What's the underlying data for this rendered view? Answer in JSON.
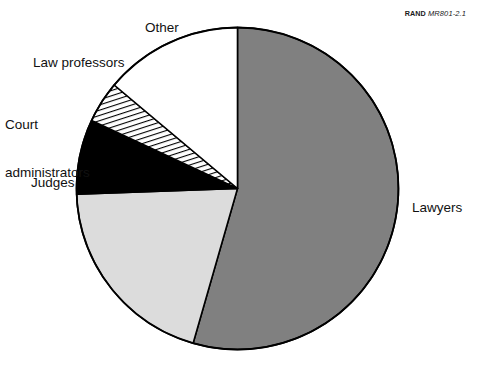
{
  "figure": {
    "source_credit": {
      "organization": "RAND",
      "document_id": "MR801-2.1"
    },
    "background_color": "#ffffff"
  },
  "chart_data": {
    "type": "pie",
    "title": "",
    "xlabel": "",
    "ylabel": "",
    "legend_position": "none",
    "grid": false,
    "start_angle_deg": 0,
    "direction": "clockwise",
    "categories": [
      "Lawyers",
      "Judges",
      "Court administrators",
      "Law professors",
      "Other"
    ],
    "values": [
      54.5,
      20.0,
      7.5,
      4.0,
      14.0
    ],
    "slices": [
      {
        "label": "Lawyers",
        "value": 54.5,
        "start_angle_deg": 0,
        "end_angle_deg": 196,
        "fill": "#808080",
        "pattern": "solid",
        "stroke": "#000000"
      },
      {
        "label": "Judges",
        "value": 20.0,
        "start_angle_deg": 196,
        "end_angle_deg": 268,
        "fill": "#dcdcdc",
        "pattern": "solid",
        "stroke": "#000000"
      },
      {
        "label": "Court administrators",
        "value": 7.5,
        "start_angle_deg": 268,
        "end_angle_deg": 295,
        "fill": "#000000",
        "pattern": "solid",
        "stroke": "#000000"
      },
      {
        "label": "Law professors",
        "value": 4.0,
        "start_angle_deg": 295,
        "end_angle_deg": 310,
        "fill": "#ffffff",
        "pattern": "diagonal-hatch",
        "stroke": "#000000"
      },
      {
        "label": "Other",
        "value": 14.0,
        "start_angle_deg": 310,
        "end_angle_deg": 360,
        "fill": "#ffffff",
        "pattern": "solid",
        "stroke": "#000000"
      }
    ]
  },
  "labels": {
    "other": "Other",
    "law_professors": "Law professors",
    "court_administrators_line1": "Court",
    "court_administrators_line2": "administrators",
    "judges": "Judges",
    "lawyers": "Lawyers"
  }
}
